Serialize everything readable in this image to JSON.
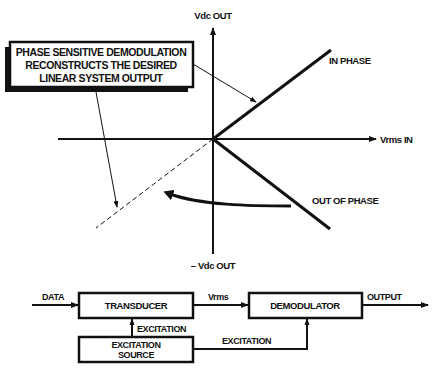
{
  "colors": {
    "ink": "#111111",
    "background": "#ffffff"
  },
  "graph": {
    "y_axis_top_label": "Vdc OUT",
    "y_axis_bottom_label": "– Vdc OUT",
    "x_axis_label": "Vrms IN",
    "in_phase_label": "IN PHASE",
    "out_of_phase_label": "OUT OF PHASE",
    "callout": {
      "lines": [
        "PHASE SENSITIVE DEMODULATION",
        "RECONSTRUCTS THE DESIRED",
        "LINEAR SYSTEM OUTPUT"
      ]
    }
  },
  "block_diagram": {
    "input_label": "DATA",
    "transducer_label": "TRANSDUCER",
    "signal_label": "Vrms",
    "demodulator_label": "DEMODULATOR",
    "output_label": "OUTPUT",
    "excitation_to_transducer_label": "EXCITATION",
    "excitation_to_demodulator_label": "EXCITATION",
    "excitation_source_lines": [
      "EXCITATION",
      "SOURCE"
    ]
  }
}
